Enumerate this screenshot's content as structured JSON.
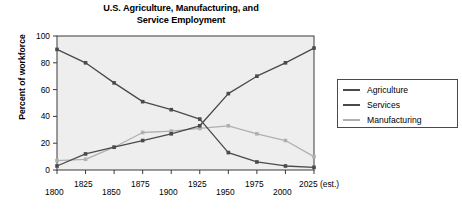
{
  "chart_data": {
    "type": "line",
    "title": "U.S. Agriculture, Manufacturing, and\nService Employment",
    "xlabel": "",
    "ylabel": "Percent of workforce",
    "xlim": [
      1800,
      2025
    ],
    "ylim": [
      0,
      100
    ],
    "grid": false,
    "legend_position": "right",
    "x": [
      1800,
      1825,
      1850,
      1875,
      1900,
      1925,
      1950,
      1975,
      2000,
      2025
    ],
    "categories": [
      "1800",
      "1825",
      "1850",
      "1875",
      "1900",
      "1925",
      "1950",
      "1975",
      "2000",
      "2025 (est.)"
    ],
    "xtick_labels": [
      "1800",
      "1825",
      "1850",
      "1875",
      "1900",
      "1925",
      "1950",
      "1975",
      "2000",
      "2025 (est.)"
    ],
    "ytick_labels": [
      "0",
      "20",
      "40",
      "60",
      "80",
      "100"
    ],
    "yticks": [
      0,
      20,
      40,
      60,
      80,
      100
    ],
    "series": [
      {
        "name": "Agriculture",
        "color": "#4a4a4a",
        "values": [
          90,
          80,
          65,
          51,
          45,
          38,
          13,
          6,
          3,
          2
        ]
      },
      {
        "name": "Services",
        "color": "#4a4a4a",
        "values": [
          3,
          12,
          17,
          22,
          27,
          33,
          57,
          70,
          80,
          91
        ]
      },
      {
        "name": "Manufacturing",
        "color": "#b0b0b0",
        "values": [
          7,
          8,
          17,
          28,
          29,
          31,
          33,
          27,
          22,
          10
        ]
      }
    ]
  },
  "legend": {
    "items": [
      {
        "label": "Agriculture",
        "color": "#4a4a4a"
      },
      {
        "label": "Services",
        "color": "#4a4a4a"
      },
      {
        "label": "Manufacturing",
        "color": "#b0b0b0"
      }
    ]
  },
  "colors": {
    "plot_background": "#eeeeee",
    "axis": "#3a3a3a",
    "dark_series": "#4a4a4a",
    "light_series": "#b0b0b0",
    "page_background": "#ffffff"
  }
}
